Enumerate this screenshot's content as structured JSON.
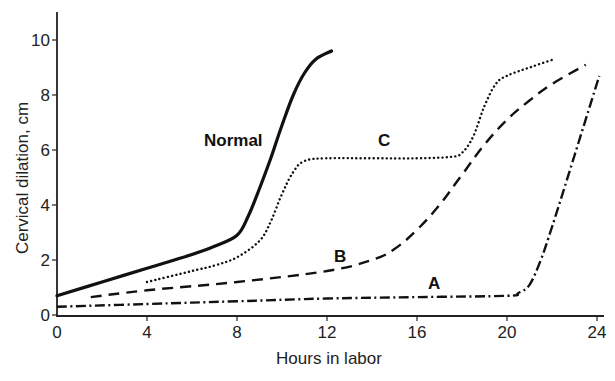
{
  "chart_data": {
    "type": "line",
    "title": "",
    "xlabel": "Hours in labor",
    "ylabel": "Cervical dilation, cm",
    "xlim": [
      0,
      24
    ],
    "ylim": [
      0,
      10
    ],
    "xticks": [
      0,
      4,
      8,
      12,
      16,
      20,
      24
    ],
    "yticks": [
      0,
      2,
      4,
      6,
      8,
      10
    ],
    "grid": false,
    "legend": "none (curves labeled inline)",
    "series": [
      {
        "name": "Normal",
        "style": "solid",
        "label_pos": [
          7.4,
          6.2
        ],
        "x": [
          0,
          2,
          4,
          6,
          7,
          8,
          8.5,
          9,
          9.5,
          10,
          10.5,
          11,
          11.5,
          12.2
        ],
        "y": [
          0.7,
          1.2,
          1.7,
          2.2,
          2.5,
          2.9,
          3.6,
          4.6,
          5.7,
          6.9,
          8.0,
          8.8,
          9.3,
          9.6
        ]
      },
      {
        "name": "C",
        "style": "dotted",
        "label_pos": [
          13.7,
          6.2
        ],
        "x": [
          4,
          6,
          7,
          8,
          9,
          9.5,
          10,
          10.5,
          11,
          12,
          14,
          16,
          17.5,
          18,
          18.5,
          19,
          19.5,
          20,
          21,
          22.1
        ],
        "y": [
          1.2,
          1.6,
          1.8,
          2.1,
          2.7,
          3.4,
          4.4,
          5.2,
          5.6,
          5.7,
          5.7,
          5.7,
          5.75,
          5.9,
          6.5,
          7.6,
          8.4,
          8.7,
          9.0,
          9.3
        ]
      },
      {
        "name": "B",
        "style": "dashed",
        "label_pos": [
          12.7,
          1.9
        ],
        "x": [
          1.5,
          4,
          8,
          12,
          14,
          15,
          16,
          17,
          18,
          19,
          20,
          21,
          22,
          23.5
        ],
        "y": [
          0.65,
          0.9,
          1.2,
          1.6,
          2.0,
          2.4,
          3.1,
          4.0,
          5.1,
          6.2,
          7.1,
          7.8,
          8.4,
          9.1
        ]
      },
      {
        "name": "A",
        "style": "dash-dot",
        "label_pos": [
          15.5,
          1.0
        ],
        "x": [
          0,
          4,
          8,
          12,
          16,
          20,
          20.5,
          21,
          21.5,
          22,
          23,
          24.1
        ],
        "y": [
          0.3,
          0.4,
          0.5,
          0.6,
          0.65,
          0.7,
          0.8,
          1.1,
          2.0,
          3.2,
          5.8,
          8.7
        ]
      }
    ]
  },
  "labels": {
    "xlabel": "Hours in labor",
    "ylabel": "Cervical dilation, cm",
    "xticks": [
      "0",
      "4",
      "8",
      "12",
      "16",
      "20",
      "24"
    ],
    "yticks": [
      "0",
      "2",
      "4",
      "6",
      "8",
      "10"
    ],
    "curves": {
      "normal": "Normal",
      "c": "C",
      "b": "B",
      "a": "A"
    }
  },
  "colors": {
    "line": "#111111",
    "axis": "#222222",
    "background": "#ffffff"
  }
}
